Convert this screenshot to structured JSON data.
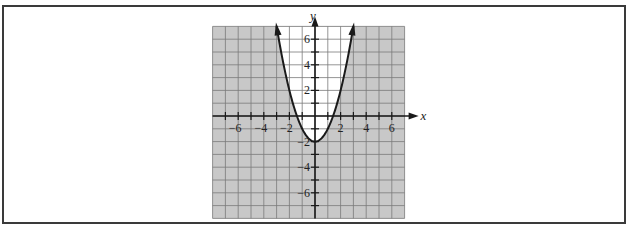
{
  "chart_data": {
    "type": "line",
    "title": "",
    "equation": "y = x^2 - 2",
    "xlabel": "x",
    "ylabel": "y",
    "xlim": [
      -8,
      7
    ],
    "ylim": [
      -8,
      7
    ],
    "grid": true,
    "x_ticks": [
      -6,
      -4,
      -2,
      2,
      4,
      6
    ],
    "y_ticks": [
      6,
      4,
      2,
      -2,
      -4,
      -6
    ],
    "x_tick_labels": [
      "−6",
      "−4",
      "−2",
      "2",
      "4",
      "6"
    ],
    "y_tick_labels": [
      "6",
      "4",
      "2",
      "−2",
      "−4",
      "−6"
    ],
    "series": [
      {
        "name": "parabola",
        "x": [
          -3,
          -2.5,
          -2,
          -1.5,
          -1,
          -0.5,
          0,
          0.5,
          1,
          1.5,
          2,
          2.5,
          3
        ],
        "values": [
          7,
          4.25,
          2,
          0.25,
          -1,
          -1.75,
          -2,
          -1.75,
          -1,
          0.25,
          2,
          4.25,
          7
        ]
      }
    ],
    "shading": {
      "inside_parabola": "#ffffff",
      "outside_parabola": "#c8c8c8",
      "description": "Region outside the parabola is shaded gray; region inside (above the curve) is white"
    },
    "colors": {
      "grid_line": "#7a7a7a",
      "curve": "#1a1a1a",
      "axis": "#1a1a1a",
      "shade": "#c8c8c8"
    }
  }
}
